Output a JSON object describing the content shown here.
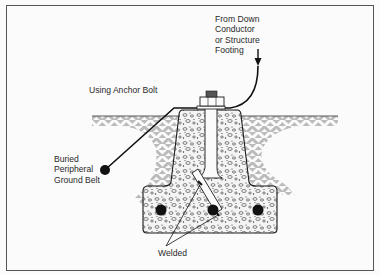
{
  "diagram": {
    "type": "cross-section",
    "labels": {
      "conductor_source": [
        "From Down",
        "Conductor",
        "or Structure",
        "Footing"
      ],
      "method": "Using Anchor Bolt",
      "ground_belt": [
        "Buried",
        "Peripheral",
        "Ground Belt"
      ],
      "welded": "Welded"
    },
    "components": [
      "down-conductor",
      "anchor-bolt-nut",
      "concrete-pier",
      "concrete-footing",
      "rebar",
      "earth-hatching",
      "ground-belt-conductor"
    ],
    "rebar_count": 3,
    "colors": {
      "ink": "#1a1a1a",
      "background": "#fbfbfb",
      "frame": "#555555"
    }
  }
}
